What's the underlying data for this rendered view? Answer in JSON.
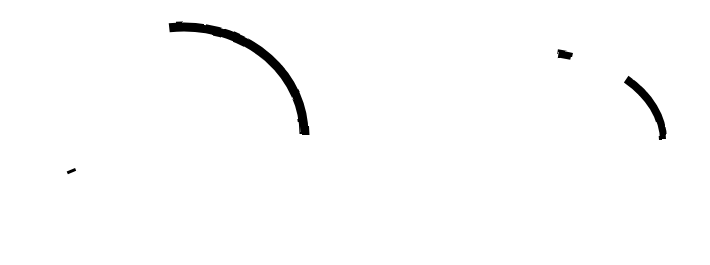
{
  "canvas": {
    "width": 710,
    "height": 265,
    "background": "#ffffff"
  },
  "shapes": [
    {
      "name": "circle-ring",
      "type": "ring",
      "cx": 184,
      "cy": 134,
      "rx": 120,
      "ry": 107,
      "stroke": "#000000",
      "stroke_width": 9,
      "gap_near": "top-center"
    },
    {
      "name": "ellipse-ring",
      "type": "ring",
      "cx": 527,
      "cy": 140,
      "rx": 136,
      "ry": 89,
      "stroke": "#000000",
      "stroke_width": 8,
      "gap_near": "top-right"
    }
  ]
}
